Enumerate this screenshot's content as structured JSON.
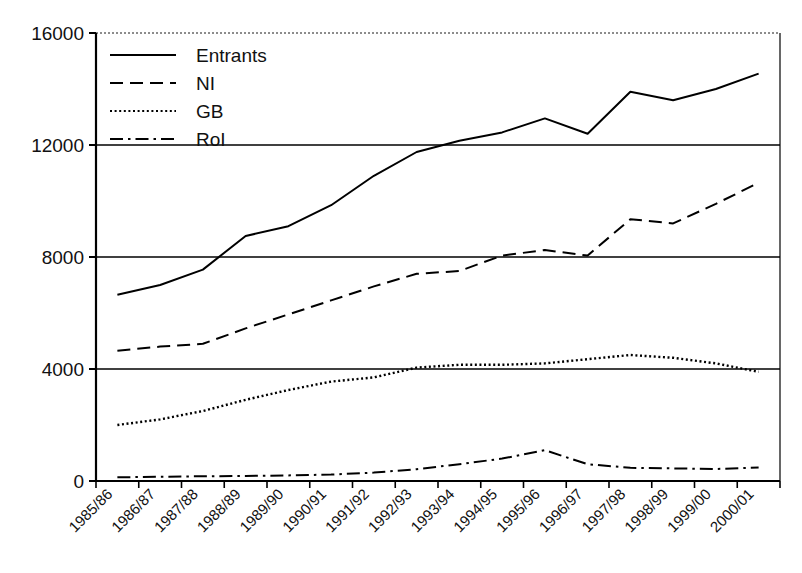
{
  "chart_data": {
    "type": "line",
    "title": "",
    "subtitle": "",
    "xlabel": "",
    "ylabel": "",
    "grid": true,
    "legend_position": "top-left-inside",
    "ylim": [
      0,
      16000
    ],
    "yticks": [
      "0",
      "4000",
      "8000",
      "12000",
      "16000"
    ],
    "ytick_values": [
      0,
      4000,
      8000,
      12000,
      16000
    ],
    "categories": [
      "1985/86",
      "1986/87",
      "1987/88",
      "1988/89",
      "1989/90",
      "1990/91",
      "1991/92",
      "1992/93",
      "1993/94",
      "1994/95",
      "1995/96",
      "1996/97",
      "1997/98",
      "1998/99",
      "1999/00",
      "2000/01"
    ],
    "series": [
      {
        "name": "Entrants",
        "style": "solid",
        "color": "#000000",
        "values": [
          6650,
          7000,
          7550,
          8750,
          9100,
          9850,
          10900,
          11750,
          12150,
          12450,
          12950,
          12400,
          13900,
          13600,
          14000,
          14550
        ]
      },
      {
        "name": "NI",
        "style": "dashed",
        "color": "#000000",
        "values": [
          4650,
          4800,
          4900,
          5450,
          5950,
          6450,
          6950,
          7400,
          7500,
          8050,
          8250,
          8050,
          9350,
          9200,
          9900,
          10650
        ]
      },
      {
        "name": "GB",
        "style": "dotted",
        "color": "#000000",
        "values": [
          2000,
          2200,
          2500,
          2900,
          3250,
          3550,
          3700,
          4050,
          4150,
          4150,
          4200,
          4350,
          4500,
          4400,
          4200,
          3900
        ]
      },
      {
        "name": "RoI",
        "style": "dashdot",
        "color": "#000000",
        "values": [
          130,
          150,
          170,
          180,
          200,
          230,
          300,
          420,
          600,
          800,
          1100,
          600,
          470,
          450,
          430,
          480
        ]
      }
    ]
  },
  "legend": {
    "items": [
      {
        "label": "Entrants",
        "style": "solid"
      },
      {
        "label": "NI",
        "style": "dashed"
      },
      {
        "label": "GB",
        "style": "dotted"
      },
      {
        "label": "RoI",
        "style": "dashdot"
      }
    ]
  },
  "axes": {
    "y_axis_name": "y-axis",
    "x_axis_name": "x-axis"
  }
}
